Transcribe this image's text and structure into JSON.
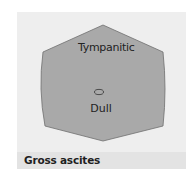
{
  "figure": {
    "caption": "Gross ascites",
    "regions": [
      {
        "id": "tympanitic",
        "label": "Tympanitic"
      },
      {
        "id": "dull",
        "label": "Dull"
      }
    ],
    "colors": {
      "panel_background": "#eeeeee",
      "caption_band": "#e3e3e3",
      "abdomen_fill": "#a9a9a9",
      "abdomen_stroke": "#6f6f6f",
      "text": "#222222"
    },
    "shapes": {
      "abdomen_outline": "hexagon-bulging-sides",
      "umbilicus_marker": "small-ellipse"
    }
  }
}
